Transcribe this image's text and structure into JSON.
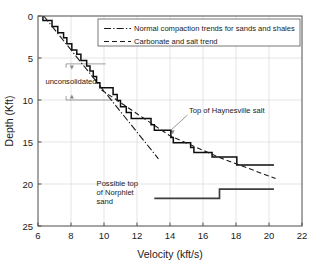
{
  "chart_data": {
    "type": "line",
    "title": "",
    "xlabel": "Velocity (kft/s)",
    "ylabel": "Depth (Kft)",
    "xlim": [
      6,
      22
    ],
    "ylim": [
      0,
      25
    ],
    "y_inverted": true,
    "xticks": [
      6,
      8,
      10,
      12,
      14,
      16,
      18,
      20,
      22
    ],
    "yticks": [
      0,
      5,
      10,
      15,
      20,
      25
    ],
    "grid": true,
    "legend_position": "top-right",
    "series": [
      {
        "name": "velocity-log",
        "style": "step",
        "points": [
          [
            6.3,
            0.0
          ],
          [
            6.3,
            0.55
          ],
          [
            6.85,
            0.55
          ],
          [
            6.85,
            1.25
          ],
          [
            7.2,
            1.25
          ],
          [
            7.2,
            2.0
          ],
          [
            7.55,
            2.0
          ],
          [
            7.55,
            2.6
          ],
          [
            7.75,
            2.6
          ],
          [
            7.75,
            3.3
          ],
          [
            8.05,
            3.3
          ],
          [
            8.05,
            4.05
          ],
          [
            8.35,
            4.05
          ],
          [
            8.35,
            4.55
          ],
          [
            8.6,
            4.55
          ],
          [
            8.6,
            5.3
          ],
          [
            8.95,
            5.3
          ],
          [
            8.95,
            5.95
          ],
          [
            9.15,
            5.95
          ],
          [
            9.15,
            6.55
          ],
          [
            9.35,
            6.55
          ],
          [
            9.35,
            7.2
          ],
          [
            9.55,
            7.2
          ],
          [
            9.55,
            7.95
          ],
          [
            9.75,
            7.95
          ],
          [
            9.75,
            8.55
          ],
          [
            10.55,
            8.55
          ],
          [
            10.55,
            9.35
          ],
          [
            10.8,
            9.35
          ],
          [
            10.8,
            10.05
          ],
          [
            11.0,
            10.05
          ],
          [
            11.0,
            10.8
          ],
          [
            11.35,
            10.8
          ],
          [
            11.35,
            11.5
          ],
          [
            11.65,
            11.5
          ],
          [
            11.65,
            12.2
          ],
          [
            12.85,
            12.2
          ],
          [
            12.85,
            12.95
          ],
          [
            13.05,
            12.95
          ],
          [
            13.05,
            13.6
          ],
          [
            14.05,
            13.6
          ],
          [
            14.05,
            14.45
          ],
          [
            14.2,
            14.45
          ],
          [
            14.2,
            15.1
          ],
          [
            15.25,
            15.1
          ],
          [
            15.25,
            15.65
          ],
          [
            15.45,
            15.65
          ],
          [
            15.45,
            16.25
          ],
          [
            16.55,
            16.25
          ],
          [
            16.55,
            16.8
          ],
          [
            18.05,
            16.8
          ],
          [
            18.05,
            17.75
          ],
          [
            20.3,
            17.75
          ]
        ]
      },
      {
        "name": "norphlet-step",
        "style": "step",
        "points": [
          [
            13.05,
            21.7
          ],
          [
            17.0,
            21.7
          ],
          [
            17.0,
            20.6
          ],
          [
            20.3,
            20.6
          ]
        ]
      },
      {
        "name": "normal-compaction-trend",
        "style": "dash-dot",
        "points": [
          [
            6.35,
            0.0
          ],
          [
            13.3,
            17.0
          ]
        ]
      },
      {
        "name": "carbonate-salt-trend",
        "style": "dashed",
        "points": [
          [
            9.85,
            8.8
          ],
          [
            13.95,
            14.2
          ],
          [
            17.0,
            16.85
          ],
          [
            20.4,
            19.35
          ]
        ]
      }
    ],
    "legend": [
      {
        "label": "Normal compaction trends for sands and shales",
        "style": "dash-dot"
      },
      {
        "label": "Carbonate and salt trend",
        "style": "dashed"
      }
    ],
    "annotations": [
      {
        "name": "unconsolidated",
        "text": "unconsolidated",
        "text_x": 6.45,
        "text_y": 8.05,
        "bracket_top_y": 5.7,
        "bracket_bottom_y": 10.0,
        "bracket_x_start": 7.7,
        "bracket_top_x_end": 10.1,
        "bracket_bottom_x_end": 10.55,
        "arrow_x": 8.05
      },
      {
        "name": "top-of-haynesville-salt",
        "text": "Top of Haynesville salt",
        "text_x": 15.15,
        "text_y": 11.55,
        "target_x": 14.0,
        "target_y": 13.7
      },
      {
        "name": "possible-top-of-norphlet-sand",
        "lines": [
          "Possible top",
          "of Norphlet",
          "sand"
        ],
        "text_x": 9.55,
        "text_y": 20.25
      }
    ],
    "colors": {
      "curve": "#0d0d0d",
      "trend": "#1a1a1a",
      "grid": "#d4d4d4",
      "frame": "#4d4d4d",
      "background": "#ffffff",
      "annotation": "#6b6b6b"
    }
  }
}
